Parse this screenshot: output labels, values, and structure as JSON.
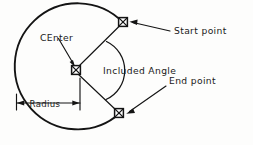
{
  "diagram": {
    "style": "technical line drawing, hand-lettered annotations",
    "stroke_color": "#141414",
    "background_color": "#fdfdfc",
    "labels": {
      "center": "CEnter",
      "start_point": "Start point",
      "end_point": "End point",
      "included_angle": "Included Angle",
      "radius": "Radius"
    },
    "markers": [
      {
        "name": "center-marker",
        "glyph": "x-in-square",
        "x": 76,
        "y": 70
      },
      {
        "name": "start-point-marker",
        "glyph": "x-in-square",
        "x": 123,
        "y": 22
      },
      {
        "name": "end-point-marker",
        "glyph": "x-in-square",
        "x": 119,
        "y": 113
      }
    ],
    "geometry": {
      "circle_center_x": 76,
      "circle_center_y": 70,
      "circle_radius": 63,
      "radius_dimension_y": 103,
      "radius_dimension_x_left": 16,
      "radius_dimension_x_right": 80
    }
  }
}
